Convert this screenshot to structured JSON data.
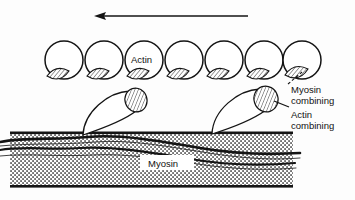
{
  "figure": {
    "title_alt": "Sliding filament cross-bridge diagram",
    "background_color": "#fdfdfd",
    "ink_color": "#111111"
  },
  "labels": {
    "actin": "Actin",
    "myosin": "Myosin",
    "myosin_combining_line1": "Myosin",
    "myosin_combining_line2": "combining",
    "actin_combining_line1": "Actin",
    "actin_combining_line2": "combining"
  },
  "arrow": {
    "name": "direction-of-movement-arrow",
    "direction": "left",
    "x_start": 248,
    "x_end": 95,
    "y": 16
  },
  "actin_filament": {
    "monomer_count": 7,
    "radius": 19,
    "center_y": 60,
    "centers_x": [
      64,
      104,
      144,
      184,
      224,
      264,
      302
    ],
    "binding_site_label": "myosin-combining-site",
    "binding_site_hatched": true
  },
  "myosin_heads": [
    {
      "name": "myosin-head-left",
      "base_x": 83,
      "base_y": 134,
      "tip_cx": 136,
      "tip_cy": 100,
      "tip_rx": 11,
      "tip_ry": 12
    },
    {
      "name": "myosin-head-right",
      "base_x": 212,
      "base_y": 133,
      "tip_cx": 266,
      "tip_cy": 99,
      "tip_rx": 12,
      "tip_ry": 13
    }
  ],
  "myosin_filament": {
    "x": 10,
    "y": 132,
    "width": 283,
    "height": 56,
    "fill_pattern": "stipple",
    "strand_count": 2
  },
  "leaders": {
    "myosin_combining": {
      "name": "myosin-combining-leader",
      "style": "dashed",
      "from_x": 289,
      "from_y": 85,
      "to_x": 308,
      "to_y": 70
    },
    "actin_combining": {
      "name": "actin-combining-leader",
      "style": "solid",
      "from_x": 289,
      "from_y": 107,
      "to_x": 272,
      "to_y": 100
    }
  }
}
